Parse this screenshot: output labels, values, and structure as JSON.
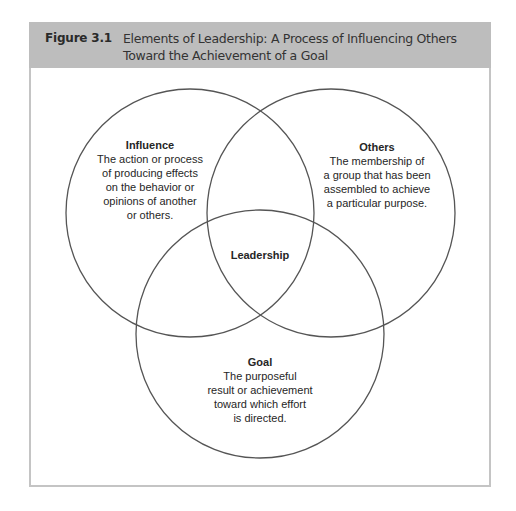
{
  "figure": {
    "label": "Figure 3.1",
    "title": "Elements of Leadership: A Process of Influencing Others Toward the Achievement of a Goal"
  },
  "diagram": {
    "type": "venn",
    "stroke_color": "#555555",
    "header_color": "#bdbdbd",
    "circles": [
      {
        "id": "influence",
        "title": "Influence",
        "description": "The action or process\nof producing effects\non the behavior or\nopinions of another\nor others."
      },
      {
        "id": "others",
        "title": "Others",
        "description": "The membership of\na group that has been\nassembled to achieve\na particular purpose."
      },
      {
        "id": "goal",
        "title": "Goal",
        "description": "The purposeful\nresult or achievement\ntoward which effort\nis directed."
      }
    ],
    "intersection": {
      "label": "Leadership"
    }
  }
}
